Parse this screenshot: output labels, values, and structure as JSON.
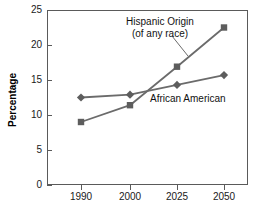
{
  "chart_data": {
    "type": "line",
    "title": "",
    "xlabel": "",
    "ylabel": "Percentage",
    "categories": [
      "1990",
      "2000",
      "2025",
      "2050"
    ],
    "xtick_labels": [
      "1990",
      "2000",
      "2025",
      "2050"
    ],
    "ytick_labels": [
      "0",
      "5",
      "10",
      "15",
      "20",
      "25"
    ],
    "ytick_values": [
      0,
      5,
      10,
      15,
      20,
      25
    ],
    "ylim": [
      0,
      25
    ],
    "grid": false,
    "legend_position": "inline-annotations",
    "series": [
      {
        "name": "Hispanic Origin (of any race)",
        "marker": "square",
        "color": "#6b6b6b",
        "values": [
          9.0,
          11.4,
          16.9,
          22.5
        ]
      },
      {
        "name": "African American",
        "marker": "diamond",
        "color": "#6b6b6b",
        "values": [
          12.5,
          12.9,
          14.3,
          15.7
        ]
      }
    ],
    "annotations": [
      {
        "id": "hispanic",
        "line1": "Hispanic Origin",
        "line2": "(of any race)"
      },
      {
        "id": "african_american",
        "line1": "African American"
      }
    ]
  },
  "axes": {
    "y_title": "Percentage",
    "tick_0": "0",
    "tick_5": "5",
    "tick_10": "10",
    "tick_15": "15",
    "tick_20": "20",
    "tick_25": "25",
    "x_1990": "1990",
    "x_2000": "2000",
    "x_2025": "2025",
    "x_2050": "2050"
  },
  "labels": {
    "hispanic_line1": "Hispanic Origin",
    "hispanic_line2": "(of any race)",
    "african_american": "African American"
  },
  "colors": {
    "line": "#6b6b6b",
    "marker": "#5d5d5d",
    "axis": "#5a5a5a",
    "text": "#111111",
    "background": "#ffffff"
  }
}
